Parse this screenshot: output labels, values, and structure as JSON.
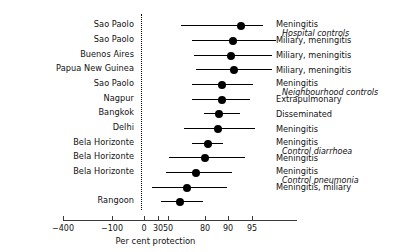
{
  "chart_data": {
    "type": "forest",
    "title": "",
    "xlabel": "Per cent protection",
    "ylabel": "",
    "axis": {
      "tick_values": [
        -400,
        -100,
        0,
        30,
        50,
        80,
        90,
        95
      ],
      "tick_labels": [
        "−400",
        "−100",
        "0",
        "30",
        "50",
        "80",
        "90",
        "95"
      ],
      "tick_x": [
        63,
        112,
        144,
        158,
        168,
        205,
        228,
        252
      ],
      "axis_start_x": 63,
      "axis_end_x": 297,
      "scale": "non-linear (logit of protection)",
      "grid": false,
      "reference_line_value": 0,
      "reference_line_x": 141,
      "reference_line_style": "dotted"
    },
    "columns": [
      "Study site",
      "Per cent protection (95% CI)",
      "Outcome"
    ],
    "rows": [
      {
        "site": "Sao Paolo",
        "outcome": "Meningitis",
        "outcome_sub": "Hospital controls",
        "estimate": 90,
        "ci_low": 68,
        "ci_high": 96,
        "y": 25,
        "px_low": 181,
        "px_point": 241,
        "px_high": 263
      },
      {
        "site": "Sao Paolo",
        "outcome": "Miliary, meningitis",
        "outcome_sub": "",
        "estimate": 87,
        "ci_low": 73,
        "ci_high": 97,
        "y": 40,
        "px_low": 192,
        "px_point": 233,
        "px_high": 276
      },
      {
        "site": "Buenos Aires",
        "outcome": "Miliary, meningitis",
        "outcome_sub": "",
        "estimate": 86,
        "ci_low": 74,
        "ci_high": 96,
        "y": 55,
        "px_low": 194,
        "px_point": 231,
        "px_high": 272
      },
      {
        "site": "Papua New Guinea",
        "outcome": "Miliary, meningitis",
        "outcome_sub": "",
        "estimate": 87,
        "ci_low": 75,
        "ci_high": 96,
        "y": 69,
        "px_low": 196,
        "px_point": 234,
        "px_high": 272
      },
      {
        "site": "Sao Paolo",
        "outcome": "Meningitis",
        "outcome_sub": "Neighbourhood controls",
        "estimate": 83,
        "ci_low": 73,
        "ci_high": 93,
        "y": 84,
        "px_low": 192,
        "px_point": 222,
        "px_high": 253
      },
      {
        "site": "Nagpur",
        "outcome": "Extrapulmonary",
        "outcome_sub": "",
        "estimate": 83,
        "ci_low": 73,
        "ci_high": 92,
        "y": 99,
        "px_low": 192,
        "px_point": 222,
        "px_high": 250
      },
      {
        "site": "Bangkok",
        "outcome": "Disseminated",
        "outcome_sub": "",
        "estimate": 82,
        "ci_low": 78,
        "ci_high": 89,
        "y": 113,
        "px_low": 204,
        "px_point": 219,
        "px_high": 240
      },
      {
        "site": "Delhi",
        "outcome": "Meningitis",
        "outcome_sub": "",
        "estimate": 82,
        "ci_low": 69,
        "ci_high": 93,
        "y": 128,
        "px_low": 184,
        "px_point": 218,
        "px_high": 255
      },
      {
        "site": "Bela Horizonte",
        "outcome": "Meningitis",
        "outcome_sub": "Control diarrhoea",
        "estimate": 77,
        "ci_low": 73,
        "ci_high": 85,
        "y": 143,
        "px_low": 192,
        "px_point": 208,
        "px_high": 223
      },
      {
        "site": "Bela Horizonte",
        "outcome": "Meningitis",
        "outcome_sub": "",
        "estimate": 75,
        "ci_low": 62,
        "ci_high": 88,
        "y": 157,
        "px_low": 169,
        "px_point": 205,
        "px_high": 245
      },
      {
        "site": "Bela Horizonte",
        "outcome": "Meningitis",
        "outcome_sub": "Control pneumonia",
        "estimate": 70,
        "ci_low": 60,
        "ci_high": 86,
        "y": 172,
        "px_low": 166,
        "px_point": 196,
        "px_high": 232
      },
      {
        "site": "Rangoon",
        "outcome": "Meningitis, miliary",
        "outcome_sub": "",
        "estimate": 64,
        "ci_low": 48,
        "ci_high": 84,
        "y": 187,
        "px_low": 152,
        "px_point": 187,
        "px_high": 227
      },
      {
        "site": "Rangoon",
        "outcome": "Meningitis, miliary",
        "outcome_sub": "",
        "estimate": 59,
        "ci_low": 54,
        "ci_high": 78,
        "y": 201,
        "px_low": 161,
        "px_point": 180,
        "px_high": 203
      }
    ]
  },
  "left_labels": [
    "Sao Paolo",
    "Sao Paolo",
    "Buenos Aires",
    "Papua New Guinea",
    "Sao Paolo",
    "Nagpur",
    "Bangkok",
    "Delhi",
    "Bela Horizonte",
    "Bela Horizonte",
    "Bela Horizonte",
    "Rangoon"
  ],
  "left_label_y": [
    25,
    40,
    55,
    69,
    84,
    99,
    113,
    128,
    143,
    157,
    172,
    201
  ],
  "right_labels": [
    {
      "main": "Meningitis",
      "sub": "Hospital controls",
      "y": 20
    },
    {
      "main": "Miliary, meningitis",
      "sub": "",
      "y": 36
    },
    {
      "main": "Miliary, meningitis",
      "sub": "",
      "y": 51
    },
    {
      "main": "Miliary, meningitis",
      "sub": "",
      "y": 66
    },
    {
      "main": "Meningitis",
      "sub": "Neighbourhood controls",
      "y": 79
    },
    {
      "main": "Extrapulmonary",
      "sub": "",
      "y": 95
    },
    {
      "main": "Disseminated",
      "sub": "",
      "y": 110
    },
    {
      "main": "Meningitis",
      "sub": "",
      "y": 125
    },
    {
      "main": "Meningitis",
      "sub": "Control diarrhoea",
      "y": 138
    },
    {
      "main": "Meningitis",
      "sub": "",
      "y": 154
    },
    {
      "main": "Meningitis",
      "sub": "Control pneumonia",
      "y": 167
    },
    {
      "main": "Meningitis, miliary",
      "sub": "",
      "y": 183
    }
  ],
  "colors": {
    "point": "#000000",
    "line": "#000000",
    "axis": "#3a3a3a",
    "text": "#111111",
    "background": "#ffffff"
  }
}
